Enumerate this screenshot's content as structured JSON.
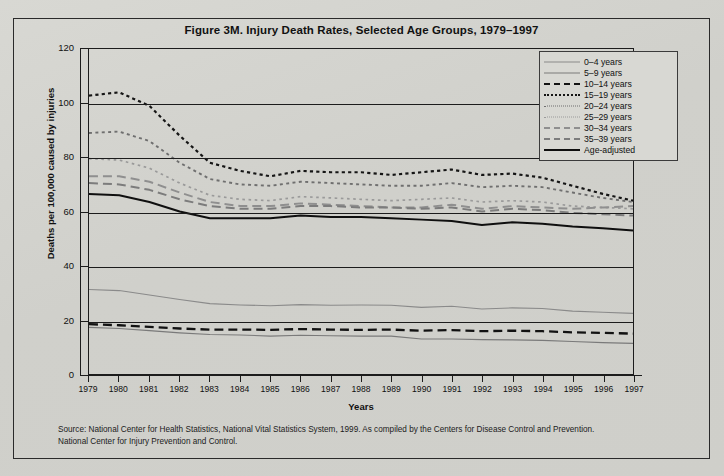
{
  "figure": {
    "title": "Figure 3M. Injury Death Rates, Selected Age Groups, 1979–1997",
    "source_line1": "Source: National Center for Health Statistics,  National Vital Statistics System, 1999.  As compiled by the Centers for Disease Control and Prevention.",
    "source_line2": "National Center for Injury Prevention and Control."
  },
  "colors": {
    "ink": "#1c1c1c",
    "paper": "#d4d4cf",
    "light_gray": "#8d8d8d",
    "mid_gray": "#6e6e6e"
  },
  "legend": {
    "position": "top-right",
    "entries": [
      {
        "label": "0–4 years",
        "style": "thin-solid-gray"
      },
      {
        "label": "5–9 years",
        "style": "thin-solid-dark"
      },
      {
        "label": "10–14 years",
        "style": "thick-dash-black"
      },
      {
        "label": "15–19 years",
        "style": "dotted-black"
      },
      {
        "label": "20–24 years",
        "style": "dotted-gray"
      },
      {
        "label": "25–29 years",
        "style": "dotted-light"
      },
      {
        "label": "30–34 years",
        "style": "dash-gray"
      },
      {
        "label": "35–39 years",
        "style": "dash-mid"
      },
      {
        "label": "Age-adjusted",
        "style": "thick-solid-black"
      }
    ]
  },
  "chart_data": {
    "type": "line",
    "title": "Figure 3M. Injury Death Rates, Selected Age Groups, 1979–1997",
    "xlabel": "Years",
    "ylabel": "Deaths per 100,000 caused by injuries",
    "xlim": [
      1979,
      1997
    ],
    "ylim": [
      0,
      120
    ],
    "yticks": [
      0,
      20,
      40,
      60,
      80,
      100,
      120
    ],
    "grid": "horizontal",
    "legend_position": "top-right",
    "x": [
      1979,
      1980,
      1981,
      1982,
      1983,
      1984,
      1985,
      1986,
      1987,
      1988,
      1989,
      1990,
      1991,
      1992,
      1993,
      1994,
      1995,
      1996,
      1997
    ],
    "series": [
      {
        "name": "0–4 years",
        "style": "thin-solid-gray",
        "values": [
          31.2,
          30.8,
          29.2,
          27.5,
          26.0,
          25.5,
          25.2,
          25.6,
          25.4,
          25.5,
          25.4,
          24.6,
          25.0,
          24.0,
          24.4,
          24.2,
          23.2,
          22.8,
          22.4
        ]
      },
      {
        "name": "5–9 years",
        "style": "thin-solid-dark",
        "values": [
          17.2,
          16.8,
          16.0,
          15.2,
          14.6,
          14.4,
          14.0,
          14.3,
          14.1,
          14.0,
          14.0,
          12.9,
          12.9,
          12.7,
          12.6,
          12.4,
          12.0,
          11.6,
          11.3
        ]
      },
      {
        "name": "10–14 years",
        "style": "thick-dash-black",
        "values": [
          18.4,
          18.0,
          17.4,
          16.8,
          16.4,
          16.4,
          16.3,
          16.6,
          16.4,
          16.3,
          16.4,
          16.0,
          16.2,
          15.8,
          16.0,
          15.8,
          15.4,
          15.2,
          14.9
        ]
      },
      {
        "name": "15–19 years",
        "style": "dotted-black",
        "values": [
          102.8,
          104.0,
          99.0,
          88.0,
          78.0,
          75.0,
          73.0,
          75.0,
          74.5,
          74.5,
          73.5,
          74.5,
          75.5,
          73.5,
          74.0,
          72.5,
          69.5,
          66.5,
          64.0
        ]
      },
      {
        "name": "20–24 years",
        "style": "dotted-gray",
        "values": [
          89.0,
          89.5,
          86.0,
          78.0,
          72.0,
          70.0,
          69.5,
          71.0,
          70.5,
          70.0,
          69.5,
          69.5,
          70.5,
          69.0,
          69.5,
          69.0,
          67.0,
          65.0,
          63.5
        ]
      },
      {
        "name": "25–29 years",
        "style": "dotted-light",
        "values": [
          79.5,
          79.0,
          76.0,
          70.5,
          66.0,
          64.5,
          64.0,
          65.5,
          65.0,
          64.5,
          64.0,
          64.5,
          65.0,
          63.5,
          64.0,
          63.5,
          62.0,
          61.5,
          61.0
        ]
      },
      {
        "name": "30–34 years",
        "style": "dash-gray",
        "values": [
          73.0,
          73.0,
          71.0,
          67.0,
          63.5,
          62.0,
          62.0,
          63.0,
          62.5,
          62.0,
          61.5,
          61.5,
          62.5,
          61.0,
          62.0,
          61.5,
          61.0,
          61.5,
          62.0
        ]
      },
      {
        "name": "35–39 years",
        "style": "dash-mid",
        "values": [
          70.5,
          70.0,
          68.0,
          64.5,
          62.0,
          61.0,
          61.0,
          62.0,
          62.0,
          61.5,
          61.5,
          61.0,
          61.5,
          60.0,
          61.0,
          60.5,
          59.5,
          59.0,
          58.5
        ]
      },
      {
        "name": "Age-adjusted",
        "style": "thick-solid-black",
        "values": [
          66.5,
          66.0,
          63.5,
          60.0,
          57.5,
          57.5,
          57.5,
          58.5,
          58.0,
          58.0,
          57.5,
          57.0,
          56.5,
          55.0,
          56.0,
          55.5,
          54.5,
          53.8,
          53.0
        ]
      }
    ]
  }
}
